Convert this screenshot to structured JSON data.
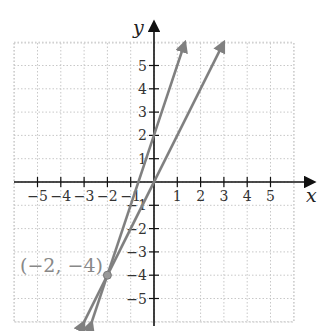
{
  "chart_data": {
    "type": "line",
    "title": "",
    "xlabel": "x",
    "ylabel": "y",
    "xlim": [
      -6,
      6
    ],
    "ylim": [
      -6,
      6
    ],
    "grid": true,
    "x_ticks": [
      -5,
      -4,
      -3,
      -2,
      -1,
      1,
      2,
      3,
      4,
      5
    ],
    "y_ticks": [
      5,
      4,
      3,
      2,
      1,
      -1,
      -2,
      -3,
      -4,
      -5
    ],
    "x_tick_labels": [
      "−5",
      "−4",
      "−3",
      "−2",
      "−1",
      "1",
      "2",
      "3",
      "4",
      "5"
    ],
    "y_tick_labels": [
      "5",
      "4",
      "3",
      "2",
      "1",
      "−1",
      "−2",
      "−3",
      "−4",
      "−5"
    ],
    "series": [
      {
        "name": "y = 3x + 2",
        "slope": 3,
        "intercept": 2,
        "x": [
          -2.67,
          1.33
        ],
        "y": [
          -6,
          6
        ]
      },
      {
        "name": "y = 2x",
        "slope": 2,
        "intercept": 0,
        "x": [
          -3,
          3
        ],
        "y": [
          -6,
          6
        ]
      }
    ],
    "annotations": [
      {
        "text": "(−2, −4)",
        "x": -2,
        "y": -4,
        "marker": "point"
      }
    ],
    "colors": {
      "lines": "#808080",
      "axes": "#111111",
      "grid": "#c8c8c8",
      "annotation": "#888888"
    }
  }
}
